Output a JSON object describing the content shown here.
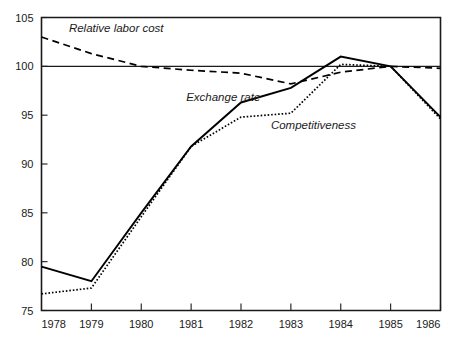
{
  "chart_data": {
    "type": "line",
    "title": "",
    "xlabel": "",
    "ylabel": "",
    "x": [
      1978,
      1979,
      1980,
      1981,
      1982,
      1983,
      1984,
      1985,
      1986
    ],
    "xtick_labels": [
      "1978",
      "1979",
      "1980",
      "1981",
      "1982",
      "1983",
      "1984",
      "1985",
      "1986"
    ],
    "ytick_labels": [
      "75",
      "80",
      "85",
      "90",
      "95",
      "100",
      "105"
    ],
    "yticks": [
      75,
      80,
      85,
      90,
      95,
      100,
      105
    ],
    "ylim": [
      75,
      105
    ],
    "xlim": [
      1978,
      1986
    ],
    "grid": false,
    "legend_position": "inline-annotations",
    "reference_line": 100,
    "series": [
      {
        "name": "Relative labor cost",
        "style": "dashed",
        "color": "#000000",
        "label_x": 1978.55,
        "label_y": 103.5,
        "values": [
          103.0,
          101.3,
          100.0,
          99.6,
          99.3,
          98.2,
          99.4,
          100.0,
          99.8
        ]
      },
      {
        "name": "Exchange rate",
        "style": "solid",
        "color": "#000000",
        "label_x": 1980.9,
        "label_y": 96.4,
        "values": [
          79.5,
          78.0,
          85.0,
          91.8,
          96.3,
          97.8,
          101.0,
          100.0,
          94.8
        ]
      },
      {
        "name": "Competitiveness",
        "style": "dotted",
        "color": "#000000",
        "label_x": 1982.6,
        "label_y": 93.6,
        "values": [
          76.7,
          77.3,
          84.6,
          91.8,
          94.8,
          95.2,
          100.2,
          100.0,
          94.6
        ]
      }
    ]
  },
  "colors": {
    "ink": "#1a1a1a",
    "background": "#ffffff",
    "series": "#000000"
  }
}
